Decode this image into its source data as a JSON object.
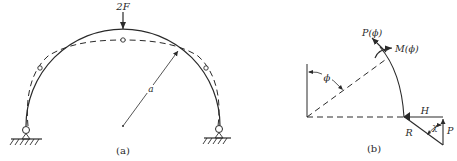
{
  "panel_a": {
    "caption": "(a)",
    "load_label": "2F",
    "radius_label": "a",
    "elements": {
      "arch": "semicircular-arch",
      "deformed_shape": "dashed-curve",
      "hinges": 3,
      "supports": 2
    }
  },
  "panel_b": {
    "caption": "(b)",
    "angle_label": "ϕ",
    "axial_force_label": "P(ϕ)",
    "moment_label": "M(ϕ)",
    "horizontal_reaction_label": "H",
    "vertical_reaction_label": "P",
    "resultant_label": "R",
    "resultant_angle_label": "χ"
  },
  "colors": {
    "ink": "#2a2a2a",
    "background": "#ffffff"
  }
}
